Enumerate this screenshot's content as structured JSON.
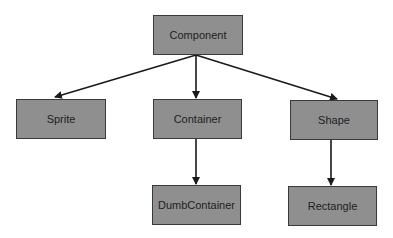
{
  "diagram": {
    "type": "class-hierarchy",
    "colors": {
      "node_fill": "#8f8f8f",
      "node_border": "#3a3a3a",
      "text": "#1e1e1e",
      "edge": "#1a1a1a",
      "background": "#ffffff"
    },
    "nodes": [
      {
        "id": "component",
        "label": "Component",
        "x": 153,
        "y": 15,
        "w": 90,
        "h": 40
      },
      {
        "id": "sprite",
        "label": "Sprite",
        "x": 16,
        "y": 99,
        "w": 90,
        "h": 40
      },
      {
        "id": "container",
        "label": "Container",
        "x": 153,
        "y": 99,
        "w": 89,
        "h": 40
      },
      {
        "id": "shape",
        "label": "Shape",
        "x": 290,
        "y": 100,
        "w": 88,
        "h": 40
      },
      {
        "id": "dumbcontainer",
        "label": "DumbContainer",
        "x": 152,
        "y": 185,
        "w": 89,
        "h": 40
      },
      {
        "id": "rectangle",
        "label": "Rectangle",
        "x": 288,
        "y": 186,
        "w": 89,
        "h": 40
      }
    ],
    "edges": [
      {
        "from": "component",
        "to": "sprite",
        "x1": 196,
        "y1": 55,
        "x2": 55,
        "y2": 97
      },
      {
        "from": "component",
        "to": "container",
        "x1": 196,
        "y1": 55,
        "x2": 196,
        "y2": 98
      },
      {
        "from": "component",
        "to": "shape",
        "x1": 196,
        "y1": 55,
        "x2": 337,
        "y2": 99
      },
      {
        "from": "container",
        "to": "dumbcontainer",
        "x1": 196,
        "y1": 139,
        "x2": 196,
        "y2": 184
      },
      {
        "from": "shape",
        "to": "rectangle",
        "x1": 331,
        "y1": 140,
        "x2": 331,
        "y2": 185
      }
    ]
  }
}
